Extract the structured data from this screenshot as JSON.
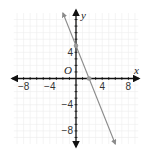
{
  "chart_data": {
    "type": "line",
    "title": "",
    "xlabel": "x",
    "ylabel": "y",
    "origin_label": "O",
    "xlim": [
      -10,
      10
    ],
    "ylim": [
      -10,
      10
    ],
    "grid": true,
    "x_ticks": [
      -8,
      -4,
      4,
      8
    ],
    "y_ticks": [
      4,
      -4,
      -8
    ],
    "x_tick_labels": [
      "−8",
      "−4",
      "4",
      "8"
    ],
    "y_tick_labels": [
      "4",
      "−4",
      "−8"
    ],
    "series": [
      {
        "name": "line",
        "equation": "y = -2.5x + 5",
        "x": [
          -2,
          6
        ],
        "y": [
          10,
          -10
        ],
        "marked_points": [
          {
            "x": 0,
            "y": 5,
            "label": "y-intercept"
          },
          {
            "x": 2,
            "y": 0,
            "label": "x-intercept"
          }
        ]
      }
    ],
    "colors": {
      "line": "#8a8a8a",
      "points": "#9a9a9a",
      "axes": "#111111",
      "grid": "#ececec"
    }
  }
}
